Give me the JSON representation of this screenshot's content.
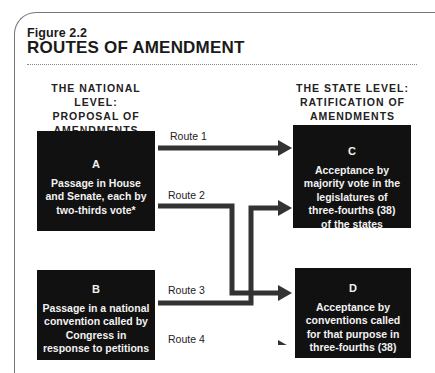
{
  "figure": {
    "label": "Figure 2.2",
    "title": "ROUTES OF AMENDMENT"
  },
  "national_level": {
    "heading_line1": "THE NATIONAL LEVEL:",
    "heading_line2": "PROPOSAL OF",
    "heading_line3": "AMENDMENTS",
    "boxes": [
      {
        "letter": "A",
        "lines": [
          "Passage in House",
          "and Senate, each by",
          "two-thirds vote*"
        ]
      },
      {
        "letter": "B",
        "lines": [
          "Passage in a national",
          "convention called by",
          "Congress in",
          "response to petitions"
        ]
      }
    ]
  },
  "state_level": {
    "heading_line1": "THE STATE LEVEL:",
    "heading_line2": "RATIFICATION OF",
    "heading_line3": "AMENDMENTS",
    "boxes": [
      {
        "letter": "C",
        "lines": [
          "Acceptance by",
          "majority vote in the",
          "legislatures of",
          "three-fourths (38)",
          "of the states"
        ]
      },
      {
        "letter": "D",
        "lines": [
          "Acceptance by",
          "conventions called",
          "for that purpose in",
          "three-fourths (38)"
        ]
      }
    ]
  },
  "routes": [
    {
      "label": "Route 1",
      "from": "A",
      "to": "C"
    },
    {
      "label": "Route 2",
      "from": "A",
      "to": "D"
    },
    {
      "label": "Route 3",
      "from": "B",
      "to": "C"
    },
    {
      "label": "Route 4",
      "from": "B",
      "to": "D"
    }
  ],
  "colors": {
    "box_fill": "#111111",
    "box_text": "#f2f2f2",
    "arrow": "#333333",
    "frame": "#777777"
  }
}
